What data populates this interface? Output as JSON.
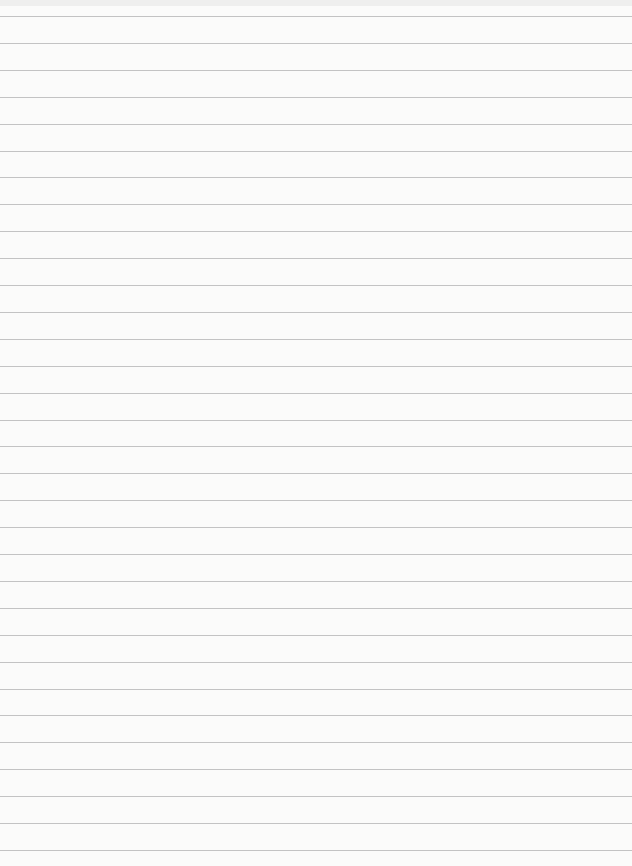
{
  "page": {
    "type": "blank lined paper",
    "background_color": "#fbfbfa",
    "line_color": "#b9b9b9",
    "line_count": 32,
    "first_line_y": 16,
    "line_spacing": 26.9
  }
}
